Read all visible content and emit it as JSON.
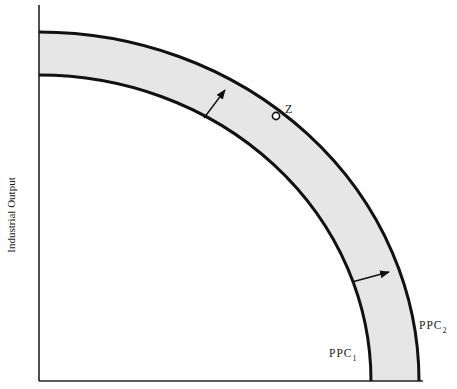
{
  "diagram": {
    "type": "production-possibility-curve-shift",
    "y_axis_label": "Industrial Output",
    "x_axis_label": "",
    "curves": [
      {
        "id": "ppc1",
        "label_main": "PPC",
        "label_sub": "1"
      },
      {
        "id": "ppc2",
        "label_main": "PPC",
        "label_sub": "2"
      }
    ],
    "point": {
      "label": "Z",
      "on_curve": "ppc2"
    },
    "shift_direction": "outward",
    "colors": {
      "band_fill": "#e6e6e6",
      "curve": "#111111",
      "axis": "#222222"
    }
  }
}
